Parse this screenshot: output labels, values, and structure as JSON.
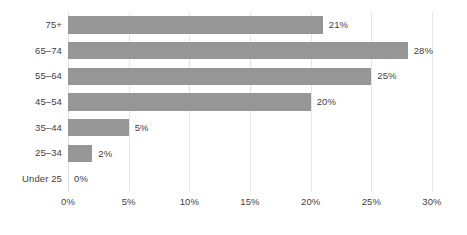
{
  "chart_data": {
    "type": "bar",
    "orientation": "horizontal",
    "title": "",
    "subtitle": "",
    "xlabel": "",
    "ylabel": "",
    "categories": [
      "Under 25",
      "25–34",
      "35–44",
      "45–54",
      "55–64",
      "65–74",
      "75+"
    ],
    "values": [
      0,
      2,
      5,
      20,
      25,
      28,
      21
    ],
    "data_labels": [
      "0%",
      "2%",
      "5%",
      "20%",
      "25%",
      "28%",
      "21%"
    ],
    "xlim": [
      0,
      30
    ],
    "xticks": [
      0,
      5,
      10,
      15,
      20,
      25,
      30
    ],
    "xtick_labels": [
      "0%",
      "5%",
      "10%",
      "15%",
      "20%",
      "25%",
      "30%"
    ],
    "ylim": null,
    "grid": "vertical-only",
    "legend": null,
    "series": [
      {
        "name": "",
        "values": [
          0,
          2,
          5,
          20,
          25,
          28,
          21
        ]
      }
    ],
    "colors": {
      "bar": "#969696",
      "gridline": "#e6e6e6",
      "text": "#3f3f3f",
      "background": "#ffffff"
    }
  }
}
